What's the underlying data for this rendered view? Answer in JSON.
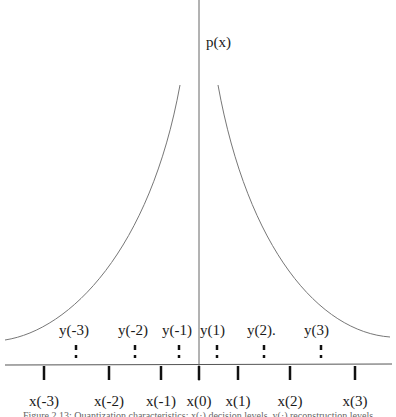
{
  "figure": {
    "y_axis_label": "p(x)",
    "decision_levels": [
      {
        "label": "x(-3)",
        "x": 44
      },
      {
        "label": "x(-2)",
        "x": 109
      },
      {
        "label": "x(-1)",
        "x": 161
      },
      {
        "label": "x(0)",
        "x": 199
      },
      {
        "label": "x(1)",
        "x": 238
      },
      {
        "label": "x(2)",
        "x": 290
      },
      {
        "label": "x(3)",
        "x": 355
      }
    ],
    "reconstruction_levels": [
      {
        "label": "y(-3)",
        "x": 76
      },
      {
        "label": "y(-2)",
        "x": 135
      },
      {
        "label": "y(-1)",
        "x": 179
      },
      {
        "label": "y(1)",
        "x": 217
      },
      {
        "label": "y(2).",
        "x": 264
      },
      {
        "label": "y(3)",
        "x": 321
      }
    ],
    "caption": "Figure 2.13: Quantization characteristics: x(·) decision levels, y(·) reconstruction levels",
    "colors": {
      "ink": "#1a1a1a",
      "curve": "#777777",
      "axis": "#555555"
    }
  }
}
